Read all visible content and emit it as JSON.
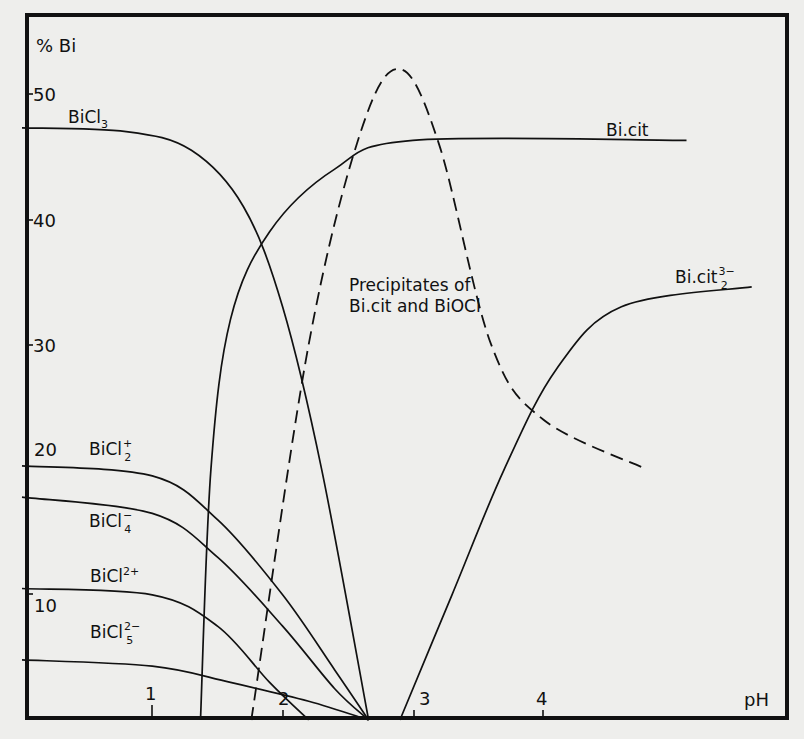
{
  "chart_data": {
    "type": "line",
    "title": "",
    "xlabel": "pH",
    "ylabel": "% Bi",
    "xlim": [
      0,
      5.9
    ],
    "ylim": [
      0,
      56
    ],
    "x_ticks": [
      1,
      2,
      3,
      4
    ],
    "y_ticks": [
      10,
      20,
      30,
      40,
      50
    ],
    "grid": false,
    "legend": "inline labels",
    "series": [
      {
        "name": "BiCl3",
        "label": "BiCl",
        "sub": "3",
        "sup": "",
        "style": "solid",
        "points": [
          [
            0,
            47.3
          ],
          [
            0.8,
            47
          ],
          [
            1.3,
            45.5
          ],
          [
            1.7,
            41
          ],
          [
            2.0,
            33
          ],
          [
            2.3,
            20
          ],
          [
            2.66,
            0
          ]
        ]
      },
      {
        "name": "BiCl2+",
        "label": "BiCl",
        "sub": "2",
        "sup": "+",
        "style": "solid",
        "points": [
          [
            0,
            20.3
          ],
          [
            1,
            19.5
          ],
          [
            1.5,
            16
          ],
          [
            2.0,
            10
          ],
          [
            2.4,
            4
          ],
          [
            2.66,
            0
          ]
        ]
      },
      {
        "name": "BiCl4-",
        "label": "BiCl",
        "sub": "4",
        "sup": "−",
        "style": "solid",
        "points": [
          [
            0,
            17.8
          ],
          [
            1,
            16.5
          ],
          [
            1.5,
            13
          ],
          [
            2.0,
            7.5
          ],
          [
            2.4,
            2.5
          ],
          [
            2.66,
            0
          ]
        ]
      },
      {
        "name": "BiCl2+ (dication)",
        "label": "BiCl",
        "sub": "",
        "sup": "2+",
        "style": "solid",
        "points": [
          [
            0,
            10.5
          ],
          [
            1,
            10
          ],
          [
            1.5,
            7.5
          ],
          [
            1.9,
            3
          ],
          [
            2.2,
            0
          ]
        ]
      },
      {
        "name": "BiCl5 2-",
        "label": "BiCl",
        "sub": "5",
        "sup": "2−",
        "style": "solid",
        "points": [
          [
            0,
            4.8
          ],
          [
            1,
            4.3
          ],
          [
            1.6,
            3
          ],
          [
            2.2,
            1.5
          ],
          [
            2.66,
            0
          ]
        ]
      },
      {
        "name": "Bi.cit",
        "label": "Bi.cit",
        "sub": "",
        "sup": "",
        "style": "solid",
        "points": [
          [
            1.37,
            0
          ],
          [
            1.45,
            20
          ],
          [
            1.6,
            32
          ],
          [
            1.9,
            39
          ],
          [
            2.4,
            44
          ],
          [
            3.0,
            46.3
          ],
          [
            5.1,
            46.3
          ]
        ]
      },
      {
        "name": "Bi.cit 3/2-",
        "label": "Bi.cit",
        "sub": "2",
        "sup": "3−",
        "style": "solid",
        "points": [
          [
            2.9,
            0
          ],
          [
            3.3,
            10
          ],
          [
            3.7,
            20
          ],
          [
            4.1,
            28
          ],
          [
            4.6,
            33
          ],
          [
            5.6,
            34.6
          ]
        ]
      },
      {
        "name": "Precipitates of Bi.cit and BiOCl",
        "label": "Precipitates of Bi.cit and BiOCl",
        "style": "dashed",
        "points": [
          [
            1.76,
            0
          ],
          [
            2.2,
            30
          ],
          [
            2.6,
            47
          ],
          [
            2.9,
            52
          ],
          [
            3.2,
            46
          ],
          [
            3.6,
            30
          ],
          [
            4.0,
            24
          ],
          [
            4.8,
            20
          ]
        ]
      }
    ],
    "annotations": [
      "Precipitates of",
      "Bi.cit and BiOCl"
    ]
  },
  "labels": {
    "y_axis": "% Bi",
    "x_axis": "pH",
    "y_ticks": [
      "50",
      "40",
      "30",
      "20",
      "10"
    ],
    "x_ticks": [
      "1",
      "2",
      "3",
      "4"
    ],
    "bicl3": {
      "base": "BiCl",
      "sub": "3"
    },
    "bicl2p": {
      "base": "BiCl",
      "sub": "2",
      "sup": "+"
    },
    "bicl4m": {
      "base": "BiCl",
      "sub": "4",
      "sup": "−"
    },
    "bicl2pp": {
      "base": "BiCl",
      "sup": "2+"
    },
    "bicl5mm": {
      "base": "BiCl",
      "sub": "5",
      "sup": "2−"
    },
    "bicit": {
      "base": "Bi.cit"
    },
    "bicit32": {
      "base": "Bi.cit",
      "sub": "2",
      "sup": "3−"
    },
    "precip_line1": "Precipitates of",
    "precip_line2": "Bi.cit and BiOCl"
  }
}
